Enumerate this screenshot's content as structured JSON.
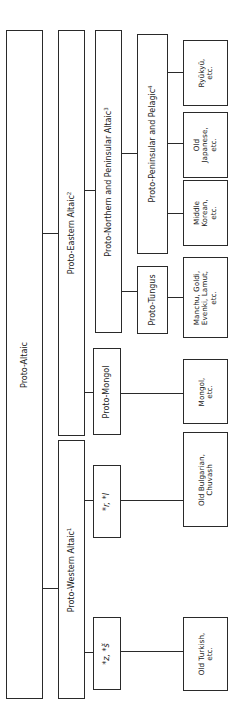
{
  "diagram": {
    "orientation": "rotated 90 degrees counter-clockwise",
    "nodes": {
      "proto_altaic": {
        "label": "Proto-Altaic"
      },
      "proto_western": {
        "label": "Proto-Western Altaic",
        "note": "1"
      },
      "proto_eastern": {
        "label": "Proto-Eastern Altaic",
        "note": "2"
      },
      "proto_north_peninsular": {
        "label": "Proto-Northern and Peninsular Altaic",
        "note": "3"
      },
      "proto_mongol": {
        "label": "Proto-Mongol"
      },
      "r_l": {
        "label": "*r, *l"
      },
      "z_s": {
        "label": "*z, *š"
      },
      "proto_peninsular_pelagic": {
        "label": "Proto-Peninsular and Pelagic",
        "note": "4"
      },
      "proto_tungus": {
        "label": "Proto-Tungus"
      },
      "ryukyu": {
        "lines": [
          "Ryūkyū,",
          "etc."
        ]
      },
      "old_japanese": {
        "lines": [
          "Old",
          "Japanese,",
          "etc."
        ]
      },
      "middle_korean": {
        "lines": [
          "Middle",
          "Korean,",
          "etc."
        ]
      },
      "manchu": {
        "lines": [
          "Manchu, Goldi,",
          "Evenki, Lamut,",
          "etc."
        ]
      },
      "mongol": {
        "lines": [
          "Mongol,",
          "etc."
        ]
      },
      "old_bulgarian": {
        "lines": [
          "Old Bulgarian,",
          "Chuvash"
        ]
      },
      "old_turkish": {
        "lines": [
          "Old Turkish,",
          "etc."
        ]
      }
    },
    "edges": [
      [
        "proto_altaic",
        "proto_eastern"
      ],
      [
        "proto_altaic",
        "proto_western"
      ],
      [
        "proto_eastern",
        "proto_north_peninsular"
      ],
      [
        "proto_eastern",
        "proto_mongol"
      ],
      [
        "proto_north_peninsular",
        "proto_peninsular_pelagic"
      ],
      [
        "proto_north_peninsular",
        "proto_tungus"
      ],
      [
        "proto_peninsular_pelagic",
        "ryukyu"
      ],
      [
        "proto_peninsular_pelagic",
        "old_japanese"
      ],
      [
        "proto_peninsular_pelagic",
        "middle_korean"
      ],
      [
        "proto_tungus",
        "manchu"
      ],
      [
        "proto_mongol",
        "mongol"
      ],
      [
        "proto_western",
        "r_l"
      ],
      [
        "proto_western",
        "z_s"
      ],
      [
        "r_l",
        "old_bulgarian"
      ],
      [
        "z_s",
        "old_turkish"
      ]
    ]
  }
}
